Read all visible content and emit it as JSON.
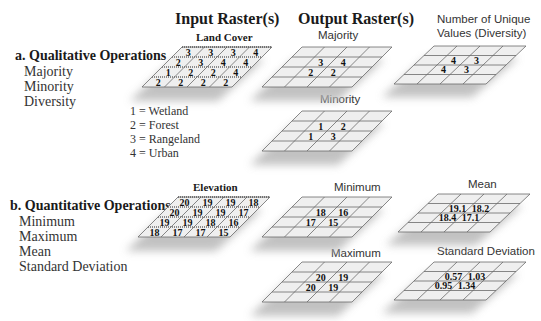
{
  "headers": {
    "input": "Input Raster(s)",
    "output": "Output Raster(s)"
  },
  "qualitative": {
    "title": "a. Qualitative Operations",
    "operations": [
      "Majority",
      "Minority",
      "Diversity"
    ],
    "input_grid": {
      "title": "Land Cover",
      "values": [
        [
          "3",
          "3",
          "3",
          "4"
        ],
        [
          "2",
          "3",
          "4",
          "4"
        ],
        [
          "1",
          "2",
          "2",
          "4"
        ],
        [
          "2",
          "2",
          "2",
          "2"
        ]
      ]
    },
    "legend": [
      "1 = Wetland",
      "2 = Forest",
      "3 = Rangeland",
      "4 = Urban"
    ],
    "outputs": [
      {
        "title": "Majority",
        "values": [
          [
            "",
            "",
            "",
            ""
          ],
          [
            "",
            "3",
            "4",
            ""
          ],
          [
            "",
            "2",
            "2",
            ""
          ],
          [
            "",
            "",
            "",
            ""
          ]
        ]
      },
      {
        "title": "Number of Unique",
        "title2": "Values (Diversity)",
        "values": [
          [
            "",
            "",
            "",
            ""
          ],
          [
            "",
            "4",
            "3",
            ""
          ],
          [
            "",
            "4",
            "3",
            ""
          ],
          [
            "",
            "",
            "",
            ""
          ]
        ]
      },
      {
        "title": "Minority",
        "values": [
          [
            "",
            "",
            "",
            ""
          ],
          [
            "",
            "1",
            "2",
            ""
          ],
          [
            "",
            "1",
            "3",
            ""
          ],
          [
            "",
            "",
            "",
            ""
          ]
        ]
      }
    ]
  },
  "quantitative": {
    "title": "b. Quantitative Operations",
    "operations": [
      "Minimum",
      "Maximum",
      "Mean",
      "Standard Deviation"
    ],
    "input_grid": {
      "title": "Elevation",
      "values": [
        [
          "20",
          "19",
          "19",
          "18"
        ],
        [
          "20",
          "19",
          "19",
          "17"
        ],
        [
          "19",
          "19",
          "18",
          "16"
        ],
        [
          "18",
          "17",
          "17",
          "15"
        ]
      ]
    },
    "outputs": [
      {
        "title": "Minimum",
        "values": [
          [
            "",
            "",
            "",
            ""
          ],
          [
            "",
            "18",
            "16",
            ""
          ],
          [
            "",
            "17",
            "15",
            ""
          ],
          [
            "",
            "",
            "",
            ""
          ]
        ]
      },
      {
        "title": "Mean",
        "values": [
          [
            "",
            "",
            "",
            ""
          ],
          [
            "",
            "19.1",
            "18.2",
            ""
          ],
          [
            "",
            "18.4",
            "17.1",
            ""
          ],
          [
            "",
            "",
            "",
            ""
          ]
        ]
      },
      {
        "title": "Maximum",
        "values": [
          [
            "",
            "",
            "",
            ""
          ],
          [
            "",
            "20",
            "19",
            ""
          ],
          [
            "",
            "20",
            "19",
            ""
          ],
          [
            "",
            "",
            "",
            ""
          ]
        ]
      },
      {
        "title": "Standard Deviation",
        "values": [
          [
            "",
            "",
            "",
            ""
          ],
          [
            "",
            "0.57",
            "1.03",
            ""
          ],
          [
            "",
            "0.95",
            "1.34",
            ""
          ],
          [
            "",
            "",
            "",
            ""
          ]
        ]
      }
    ]
  },
  "colors": {
    "cell_fill": "#efefef",
    "grid_line": "#6a6a6a",
    "shadow": "#b8b8b8"
  }
}
